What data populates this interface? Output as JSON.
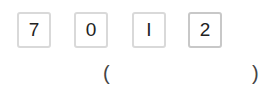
{
  "cards": [
    {
      "label": "7"
    },
    {
      "label": "0"
    },
    {
      "label": "I"
    },
    {
      "label": "2"
    }
  ],
  "answer": {
    "open_paren": "(",
    "value": "",
    "close_paren": ")"
  }
}
